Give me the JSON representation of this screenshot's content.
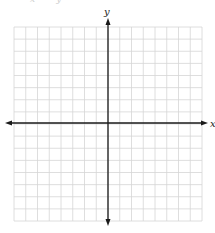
{
  "header": {
    "clipped_text": "x   = y"
  },
  "diagram": {
    "type": "coordinate-plane",
    "x_axis_label": "x",
    "y_axis_label": "y",
    "grid": {
      "columns": 16,
      "rows": 16,
      "x_range": [
        -8,
        8
      ],
      "y_range": [
        -8,
        8
      ],
      "line_color": "#d6d6d6",
      "axis_color": "#1a1a1a"
    }
  }
}
